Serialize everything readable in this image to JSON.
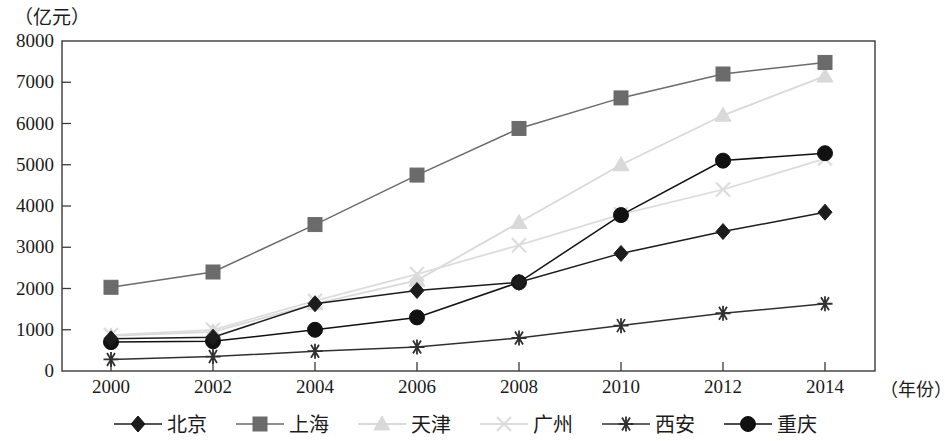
{
  "axes": {
    "y_unit_label": "（亿元）",
    "x_title": "（年份）",
    "y_ticks": [
      "8000",
      "7000",
      "6000",
      "5000",
      "4000",
      "3000",
      "2000",
      "1000",
      "0"
    ],
    "x_ticks": [
      "2000",
      "2002",
      "2004",
      "2006",
      "2008",
      "2010",
      "2012",
      "2014"
    ]
  },
  "legend": {
    "items": [
      {
        "label": "北京",
        "marker": "diamond-marker",
        "color": "#1c1c1c"
      },
      {
        "label": "上海",
        "marker": "square-marker",
        "color": "#6b6b6b"
      },
      {
        "label": "天津",
        "marker": "triangle-marker",
        "color": "#d9d9d9"
      },
      {
        "label": "广州",
        "marker": "cross-marker",
        "color": "#dcdcdc"
      },
      {
        "label": "西安",
        "marker": "asterisk-marker",
        "color": "#303030"
      },
      {
        "label": "重庆",
        "marker": "circle-marker",
        "color": "#111111"
      }
    ]
  },
  "chart_data": {
    "type": "line",
    "title": "",
    "xlabel": "（年份）",
    "ylabel": "（亿元）",
    "x": [
      2000,
      2002,
      2004,
      2006,
      2008,
      2010,
      2012,
      2014
    ],
    "categories": [
      "2000",
      "2002",
      "2004",
      "2006",
      "2008",
      "2010",
      "2012",
      "2014"
    ],
    "xlim": [
      1999,
      2015
    ],
    "ylim": [
      0,
      8000
    ],
    "ytick_step": 1000,
    "grid": false,
    "legend_position": "bottom",
    "series": [
      {
        "name": "北京",
        "marker": "diamond",
        "color": "#1c1c1c",
        "values": [
          780,
          820,
          1630,
          1950,
          2150,
          2850,
          3380,
          3850
        ]
      },
      {
        "name": "上海",
        "marker": "square",
        "color": "#6b6b6b",
        "values": [
          2030,
          2400,
          3550,
          4750,
          5880,
          6620,
          7200,
          7480
        ]
      },
      {
        "name": "天津",
        "marker": "triangle",
        "color": "#d9d9d9",
        "values": [
          850,
          950,
          1630,
          2200,
          3600,
          5000,
          6200,
          7150
        ]
      },
      {
        "name": "广州",
        "marker": "cross",
        "color": "#dcdcdc",
        "values": [
          870,
          1000,
          1700,
          2350,
          3050,
          3800,
          4400,
          5150
        ]
      },
      {
        "name": "西安",
        "marker": "asterisk",
        "color": "#303030",
        "values": [
          280,
          350,
          480,
          580,
          800,
          1100,
          1400,
          1630
        ]
      },
      {
        "name": "重庆",
        "marker": "circle",
        "color": "#111111",
        "values": [
          700,
          720,
          1000,
          1300,
          2150,
          3780,
          5100,
          5280
        ]
      }
    ]
  }
}
